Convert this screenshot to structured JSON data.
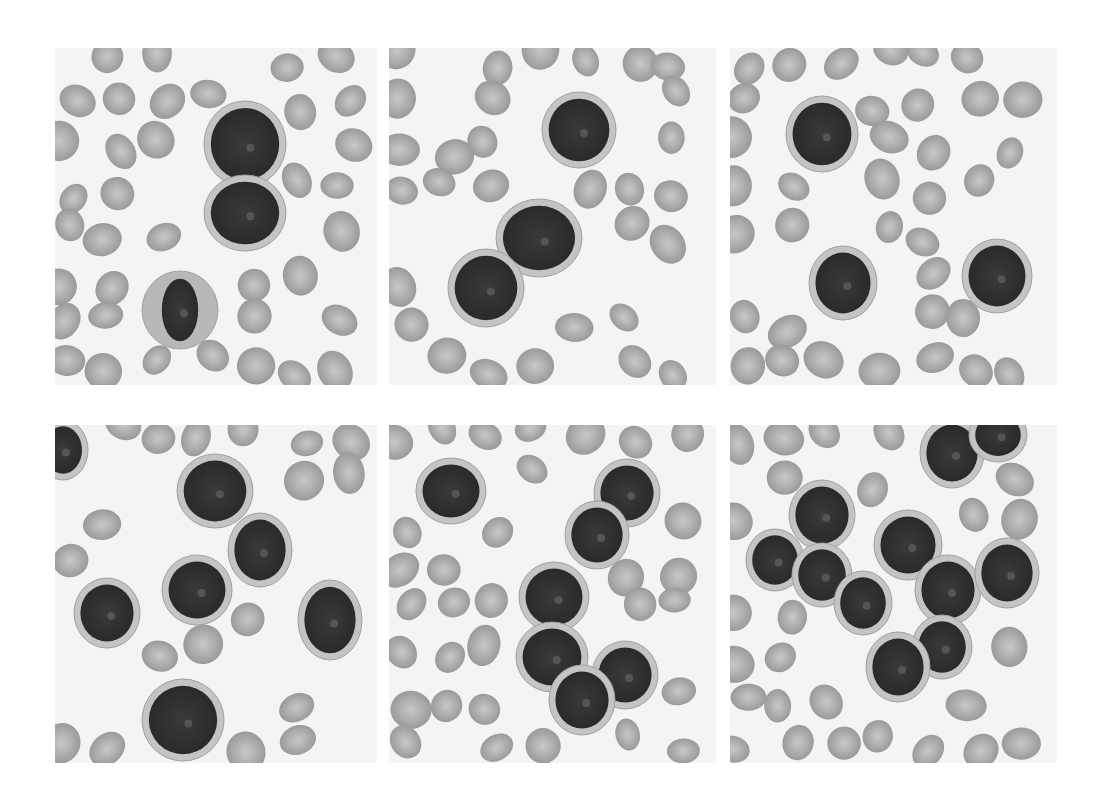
{
  "figure": {
    "layout": {
      "rows": 2,
      "cols": 3
    },
    "colors": {
      "background": "#ffffff",
      "rbc": "#9a9a9a",
      "rbc_center": "#c8c8c8",
      "nucleus": "#2a2a2a",
      "cytoplasm": "#c4c4c4",
      "field": "#f4f4f4"
    },
    "panels": [
      {
        "id": "top-left",
        "x": 55,
        "y": 48,
        "w": 322,
        "h": 337,
        "cells": [
          {
            "cx": 190,
            "cy": 96,
            "rx": 36,
            "ry": 38
          },
          {
            "cx": 190,
            "cy": 165,
            "rx": 36,
            "ry": 33
          },
          {
            "cx": 125,
            "cy": 262,
            "rx": 26,
            "ry": 33,
            "granular": true
          }
        ]
      },
      {
        "id": "top-middle",
        "x": 389,
        "y": 48,
        "w": 327,
        "h": 337,
        "cells": [
          {
            "cx": 190,
            "cy": 82,
            "rx": 32,
            "ry": 33
          },
          {
            "cx": 150,
            "cy": 190,
            "rx": 38,
            "ry": 34
          },
          {
            "cx": 97,
            "cy": 240,
            "rx": 33,
            "ry": 34
          }
        ]
      },
      {
        "id": "top-right",
        "x": 730,
        "y": 48,
        "w": 327,
        "h": 337,
        "cells": [
          {
            "cx": 92,
            "cy": 86,
            "rx": 31,
            "ry": 33
          },
          {
            "cx": 113,
            "cy": 235,
            "rx": 29,
            "ry": 32
          },
          {
            "cx": 267,
            "cy": 228,
            "rx": 30,
            "ry": 32
          }
        ]
      },
      {
        "id": "bottom-left",
        "x": 55,
        "y": 425,
        "w": 322,
        "h": 338,
        "cells": [
          {
            "cx": 160,
            "cy": 66,
            "rx": 33,
            "ry": 32
          },
          {
            "cx": 205,
            "cy": 125,
            "rx": 27,
            "ry": 32
          },
          {
            "cx": 142,
            "cy": 165,
            "rx": 30,
            "ry": 30
          },
          {
            "cx": 52,
            "cy": 188,
            "rx": 28,
            "ry": 30
          },
          {
            "cx": 275,
            "cy": 195,
            "rx": 27,
            "ry": 35
          },
          {
            "cx": 128,
            "cy": 295,
            "rx": 36,
            "ry": 36
          },
          {
            "cx": 8,
            "cy": 25,
            "rx": 20,
            "ry": 25
          }
        ]
      },
      {
        "id": "bottom-middle",
        "x": 389,
        "y": 425,
        "w": 327,
        "h": 338,
        "cells": [
          {
            "cx": 62,
            "cy": 66,
            "rx": 30,
            "ry": 28
          },
          {
            "cx": 238,
            "cy": 68,
            "rx": 28,
            "ry": 29
          },
          {
            "cx": 208,
            "cy": 110,
            "rx": 27,
            "ry": 29
          },
          {
            "cx": 165,
            "cy": 172,
            "rx": 30,
            "ry": 30
          },
          {
            "cx": 163,
            "cy": 232,
            "rx": 31,
            "ry": 30
          },
          {
            "cx": 236,
            "cy": 250,
            "rx": 28,
            "ry": 29
          },
          {
            "cx": 193,
            "cy": 275,
            "rx": 28,
            "ry": 30
          }
        ]
      },
      {
        "id": "bottom-right",
        "x": 730,
        "y": 425,
        "w": 327,
        "h": 338,
        "cells": [
          {
            "cx": 222,
            "cy": 28,
            "rx": 27,
            "ry": 30
          },
          {
            "cx": 268,
            "cy": 10,
            "rx": 24,
            "ry": 22
          },
          {
            "cx": 92,
            "cy": 90,
            "rx": 28,
            "ry": 30
          },
          {
            "cx": 45,
            "cy": 135,
            "rx": 24,
            "ry": 26
          },
          {
            "cx": 92,
            "cy": 150,
            "rx": 25,
            "ry": 27
          },
          {
            "cx": 178,
            "cy": 120,
            "rx": 29,
            "ry": 30
          },
          {
            "cx": 133,
            "cy": 178,
            "rx": 24,
            "ry": 27
          },
          {
            "cx": 218,
            "cy": 165,
            "rx": 28,
            "ry": 30
          },
          {
            "cx": 277,
            "cy": 148,
            "rx": 27,
            "ry": 30
          },
          {
            "cx": 212,
            "cy": 222,
            "rx": 25,
            "ry": 27
          },
          {
            "cx": 168,
            "cy": 242,
            "rx": 27,
            "ry": 30
          }
        ]
      }
    ]
  }
}
